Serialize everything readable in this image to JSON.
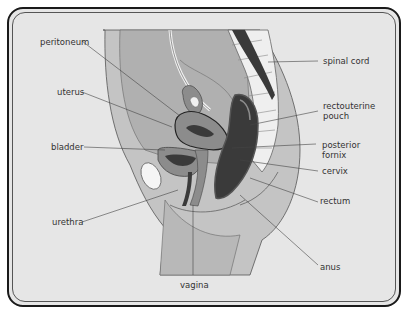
{
  "figure": {
    "labels": {
      "peritoneum": "peritoneum",
      "uterus": "uterus",
      "bladder": "bladder",
      "urethra": "urethra",
      "vagina": "vagina",
      "spinal_cord": "spinal cord",
      "rectouterine_pouch_line1": "rectouterine",
      "rectouterine_pouch_line2": "pouch",
      "posterior_fornix_line1": "posterior",
      "posterior_fornix_line2": "fornix",
      "cervix": "cervix",
      "rectum": "rectum",
      "anus": "anus"
    },
    "colors": {
      "background": "#e6e6e6",
      "frame": "#1a1a1a",
      "body_tissue": "#bdbdbd",
      "organ_mid": "#8c8c8c",
      "organ_dark": "#3a3a3a",
      "bone_light": "#f2f2f2"
    }
  }
}
